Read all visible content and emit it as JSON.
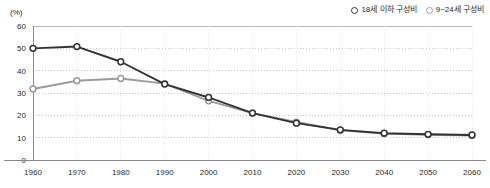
{
  "chart_data": {
    "type": "line",
    "title": "",
    "xlabel": "",
    "ylabel": "",
    "unit_label": "(%)",
    "categories": [
      "1960",
      "1970",
      "1980",
      "1990",
      "2000",
      "2010",
      "2020",
      "2030",
      "2040",
      "2050",
      "2060"
    ],
    "x": [
      1960,
      1970,
      1980,
      1990,
      2000,
      2010,
      2020,
      2030,
      2040,
      2050,
      2060
    ],
    "ylim": [
      0,
      60
    ],
    "yticks": [
      0,
      10,
      20,
      30,
      40,
      50,
      60
    ],
    "grid": true,
    "legend_position": "top-right",
    "series": [
      {
        "name": "18세 이하 구성비",
        "color": "#333333",
        "marker": "open-circle",
        "values": [
          50.0,
          50.8,
          44.0,
          34.0,
          28.0,
          21.0,
          16.5,
          13.5,
          12.0,
          11.5,
          11.2
        ]
      },
      {
        "name": "9~24세 구성비",
        "color": "#9b9b9b",
        "marker": "open-circle",
        "values": [
          31.8,
          35.5,
          36.5,
          34.2,
          26.5,
          21.0,
          17.0,
          13.3,
          11.8,
          11.3,
          11.0
        ]
      }
    ]
  },
  "legend": {
    "entries": [
      {
        "label": "18세 이하 구성비"
      },
      {
        "label": "9~24세 구성비"
      }
    ]
  },
  "axis": {
    "unit": "(%)",
    "y_labels": [
      "60",
      "50",
      "40",
      "30",
      "20",
      "10",
      "0"
    ],
    "x_labels": [
      "1960",
      "1970",
      "1980",
      "1990",
      "2000",
      "2010",
      "2020",
      "2030",
      "2040",
      "2050",
      "2060"
    ]
  },
  "colors": {
    "series_dark": "#333333",
    "series_light": "#9b9b9b",
    "grid": "#b9b9b9",
    "axis": "#8a8a8a",
    "text": "#2b2b2b"
  }
}
